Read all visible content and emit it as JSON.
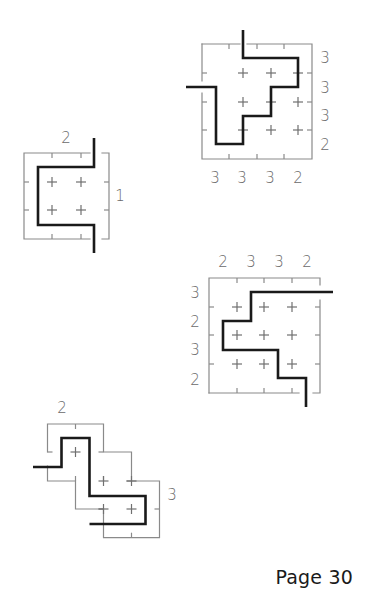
{
  "page": {
    "label": "Page 30"
  },
  "colors": {
    "grid": "#8a8a8a",
    "path": "#1a1a1a",
    "clue": "#6a6a6a",
    "background": "#ffffff"
  },
  "puzzles": [
    {
      "id": "puzzle-1",
      "borders": [
        [
          [
            202,
            44
          ],
          [
            240,
            44
          ]
        ],
        [
          [
            247,
            44
          ],
          [
            312,
            44
          ],
          [
            312,
            159
          ],
          [
            202,
            159
          ],
          [
            202,
            93
          ]
        ],
        [
          [
            202,
            81
          ],
          [
            202,
            44
          ]
        ]
      ],
      "ticks": [
        [
          [
            229,
            44
          ],
          [
            229,
            49
          ]
        ],
        [
          [
            257,
            44
          ],
          [
            257,
            49
          ]
        ],
        [
          [
            284,
            44
          ],
          [
            284,
            49
          ]
        ],
        [
          [
            229,
            159
          ],
          [
            229,
            154
          ]
        ],
        [
          [
            257,
            159
          ],
          [
            257,
            154
          ]
        ],
        [
          [
            284,
            159
          ],
          [
            284,
            154
          ]
        ],
        [
          [
            202,
            73
          ],
          [
            207,
            73
          ]
        ],
        [
          [
            202,
            102
          ],
          [
            207,
            102
          ]
        ],
        [
          [
            202,
            130
          ],
          [
            207,
            130
          ]
        ],
        [
          [
            312,
            73
          ],
          [
            307,
            73
          ]
        ],
        [
          [
            312,
            102
          ],
          [
            307,
            102
          ]
        ],
        [
          [
            312,
            130
          ],
          [
            307,
            130
          ]
        ]
      ],
      "pluses": [
        [
          243,
          73
        ],
        [
          271,
          73
        ],
        [
          298,
          73
        ],
        [
          243,
          102
        ],
        [
          271,
          102
        ],
        [
          298,
          102
        ],
        [
          243,
          130
        ],
        [
          271,
          130
        ],
        [
          298,
          130
        ]
      ],
      "path": [
        [
          243,
          30
        ],
        [
          243,
          58
        ],
        [
          298,
          58
        ],
        [
          298,
          87
        ],
        [
          271,
          87
        ],
        [
          271,
          116
        ],
        [
          243,
          116
        ],
        [
          243,
          144
        ],
        [
          216,
          144
        ],
        [
          216,
          87
        ],
        [
          186,
          87
        ]
      ],
      "clues": [
        {
          "x": 325,
          "y": 58,
          "t": "3"
        },
        {
          "x": 325,
          "y": 88,
          "t": "3"
        },
        {
          "x": 325,
          "y": 116,
          "t": "3"
        },
        {
          "x": 325,
          "y": 145,
          "t": "2"
        },
        {
          "x": 215,
          "y": 178,
          "t": "3"
        },
        {
          "x": 242,
          "y": 178,
          "t": "3"
        },
        {
          "x": 270,
          "y": 178,
          "t": "3"
        },
        {
          "x": 298,
          "y": 178,
          "t": "2"
        }
      ]
    },
    {
      "id": "puzzle-2",
      "borders": [
        [
          [
            90,
            153
          ],
          [
            24,
            153
          ],
          [
            24,
            239
          ],
          [
            90,
            239
          ]
        ],
        [
          [
            102,
            153
          ],
          [
            109,
            153
          ],
          [
            109,
            239
          ],
          [
            102,
            239
          ]
        ]
      ],
      "ticks": [
        [
          [
            52,
            153
          ],
          [
            52,
            158
          ]
        ],
        [
          [
            81,
            153
          ],
          [
            81,
            158
          ]
        ],
        [
          [
            52,
            239
          ],
          [
            52,
            234
          ]
        ],
        [
          [
            81,
            239
          ],
          [
            81,
            234
          ]
        ],
        [
          [
            24,
            182
          ],
          [
            29,
            182
          ]
        ],
        [
          [
            24,
            210
          ],
          [
            29,
            210
          ]
        ],
        [
          [
            109,
            182
          ],
          [
            104,
            182
          ]
        ],
        [
          [
            109,
            210
          ],
          [
            104,
            210
          ]
        ]
      ],
      "pluses": [
        [
          52,
          182
        ],
        [
          81,
          182
        ],
        [
          52,
          210
        ],
        [
          81,
          210
        ]
      ],
      "path": [
        [
          94,
          138
        ],
        [
          94,
          167
        ],
        [
          38,
          167
        ],
        [
          38,
          225
        ],
        [
          94,
          225
        ],
        [
          94,
          253
        ]
      ],
      "clues": [
        {
          "x": 66,
          "y": 138,
          "t": "2"
        },
        {
          "x": 120,
          "y": 196,
          "t": "1"
        }
      ]
    },
    {
      "id": "puzzle-3",
      "borders": [
        [
          [
            209,
            393
          ],
          [
            209,
            278
          ],
          [
            320,
            278
          ],
          [
            320,
            285
          ]
        ],
        [
          [
            320,
            300
          ],
          [
            320,
            393
          ],
          [
            313,
            393
          ]
        ],
        [
          [
            299,
            393
          ],
          [
            209,
            393
          ]
        ]
      ],
      "ticks": [
        [
          [
            237,
            278
          ],
          [
            237,
            283
          ]
        ],
        [
          [
            264,
            278
          ],
          [
            264,
            283
          ]
        ],
        [
          [
            292,
            278
          ],
          [
            292,
            283
          ]
        ],
        [
          [
            237,
            393
          ],
          [
            237,
            388
          ]
        ],
        [
          [
            264,
            393
          ],
          [
            264,
            388
          ]
        ],
        [
          [
            292,
            393
          ],
          [
            292,
            388
          ]
        ],
        [
          [
            209,
            307
          ],
          [
            214,
            307
          ]
        ],
        [
          [
            209,
            335
          ],
          [
            214,
            335
          ]
        ],
        [
          [
            209,
            364
          ],
          [
            214,
            364
          ]
        ],
        [
          [
            320,
            307
          ],
          [
            315,
            307
          ]
        ],
        [
          [
            320,
            335
          ],
          [
            315,
            335
          ]
        ],
        [
          [
            320,
            364
          ],
          [
            315,
            364
          ]
        ]
      ],
      "pluses": [
        [
          237,
          307
        ],
        [
          264,
          307
        ],
        [
          292,
          307
        ],
        [
          237,
          335
        ],
        [
          264,
          335
        ],
        [
          292,
          335
        ],
        [
          237,
          364
        ],
        [
          264,
          364
        ],
        [
          292,
          364
        ]
      ],
      "path": [
        [
          333,
          292
        ],
        [
          251,
          292
        ],
        [
          251,
          321
        ],
        [
          223,
          321
        ],
        [
          223,
          350
        ],
        [
          278,
          350
        ],
        [
          278,
          378
        ],
        [
          306,
          378
        ],
        [
          306,
          407
        ]
      ],
      "clues": [
        {
          "x": 223,
          "y": 262,
          "t": "2"
        },
        {
          "x": 251,
          "y": 262,
          "t": "3"
        },
        {
          "x": 279,
          "y": 262,
          "t": "3"
        },
        {
          "x": 307,
          "y": 262,
          "t": "2"
        },
        {
          "x": 195,
          "y": 293,
          "t": "3"
        },
        {
          "x": 195,
          "y": 322,
          "t": "2"
        },
        {
          "x": 195,
          "y": 350,
          "t": "3"
        },
        {
          "x": 195,
          "y": 380,
          "t": "2"
        }
      ]
    },
    {
      "id": "puzzle-4",
      "borders": [
        [
          [
            47.5,
            452
          ],
          [
            47.5,
            424
          ],
          [
            103.5,
            424
          ],
          [
            103.5,
            452
          ],
          [
            131.5,
            452
          ],
          [
            131.5,
            481
          ],
          [
            159.5,
            481
          ],
          [
            159.5,
            537.7
          ],
          [
            103.5,
            537.7
          ],
          [
            103.5,
            509
          ],
          [
            75.5,
            509
          ],
          [
            75.5,
            481
          ],
          [
            47.5,
            481
          ],
          [
            47.5,
            466
          ]
        ]
      ],
      "ticks": [
        [
          [
            75.5,
            424
          ],
          [
            75.5,
            429
          ]
        ],
        [
          [
            47.5,
            452
          ],
          [
            52.5,
            452
          ]
        ],
        [
          [
            103.5,
            452
          ],
          [
            98.5,
            452
          ]
        ],
        [
          [
            75.5,
            481
          ],
          [
            75.5,
            476
          ]
        ],
        [
          [
            131.5,
            481
          ],
          [
            126.5,
            481
          ]
        ],
        [
          [
            103.5,
            481
          ],
          [
            103.5,
            476
          ]
        ],
        [
          [
            103.5,
            509
          ],
          [
            98.5,
            509
          ]
        ],
        [
          [
            159.5,
            509
          ],
          [
            154.5,
            509
          ]
        ],
        [
          [
            131.5,
            537.7
          ],
          [
            131.5,
            532.7
          ]
        ]
      ],
      "pluses": [
        [
          75.5,
          452
        ],
        [
          103.5,
          481
        ],
        [
          131.5,
          481
        ],
        [
          103.5,
          509
        ],
        [
          131.5,
          509
        ]
      ],
      "path": [
        [
          33,
          467
        ],
        [
          61.5,
          467
        ],
        [
          61.5,
          438
        ],
        [
          89.5,
          438
        ],
        [
          89.5,
          496
        ],
        [
          145.5,
          496
        ],
        [
          145.5,
          524
        ],
        [
          89.5,
          524
        ]
      ],
      "clues": [
        {
          "x": 62,
          "y": 408,
          "t": "2"
        },
        {
          "x": 172,
          "y": 495,
          "t": "3"
        }
      ]
    }
  ]
}
